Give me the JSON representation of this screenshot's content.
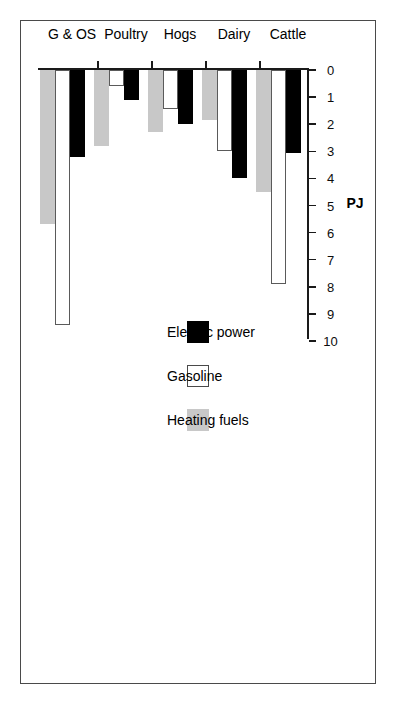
{
  "chart_data": {
    "type": "bar",
    "orientation": "horizontal",
    "title": "",
    "xlabel": "PJ",
    "ylabel": "",
    "categories": [
      "Cattle",
      "Dairy",
      "Hogs",
      "Poultry",
      "G & OS"
    ],
    "series": [
      {
        "name": "Electric power",
        "color": "#000000",
        "values": [
          3.05,
          4.0,
          2.0,
          1.1,
          3.2
        ]
      },
      {
        "name": "Gasoline",
        "color": "#ffffff",
        "values": [
          7.9,
          3.0,
          1.45,
          0.6,
          9.4
        ]
      },
      {
        "name": "Heating fuels",
        "color": "#c8c8c8",
        "values": [
          4.5,
          1.85,
          2.3,
          2.8,
          5.7
        ]
      }
    ],
    "xlim": [
      0,
      10
    ],
    "xticks": [
      0,
      1,
      2,
      3,
      4,
      5,
      6,
      7,
      8,
      9,
      10
    ],
    "xtick_labels": [
      "0",
      "1",
      "2",
      "3",
      "4",
      "5",
      "6",
      "7",
      "8",
      "9",
      "10"
    ],
    "grid": false,
    "legend_position": "middle-right"
  },
  "axis": {
    "unit_label": "PJ",
    "ticks": [
      "0",
      "1",
      "2",
      "3",
      "4",
      "5",
      "6",
      "7",
      "8",
      "9",
      "10"
    ]
  },
  "categories": [
    "Cattle",
    "Dairy",
    "Hogs",
    "Poultry",
    "G & OS"
  ],
  "legend": {
    "items": [
      {
        "label": "Electric power",
        "swatch": "black-square-icon"
      },
      {
        "label": "Gasoline",
        "swatch": "white-square-icon"
      },
      {
        "label": "Heating fuels",
        "swatch": "gray-square-icon"
      }
    ]
  }
}
